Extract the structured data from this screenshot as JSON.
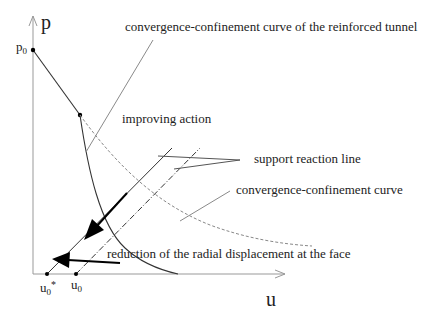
{
  "diagram": {
    "axes": {
      "y_label": "p",
      "x_label": "u",
      "y_tick": {
        "base": "p",
        "sub": "0"
      },
      "x_ticks": [
        {
          "base": "u",
          "sub": "0",
          "sup": "*"
        },
        {
          "base": "u",
          "sub": "0",
          "sup": ""
        }
      ]
    },
    "labels": {
      "reinforced_curve": "convergence-confinement curve of the reinforced tunnel",
      "improving_action": "improving action",
      "support_reaction_line": "support reaction line",
      "cc_curve": "convergence-confinement curve",
      "reduction": "reduction of the radial displacement at the face"
    },
    "colors": {
      "line": "#333333",
      "light_line": "#8a8a8a",
      "axis": "#999999",
      "arrow": "#000000"
    }
  }
}
